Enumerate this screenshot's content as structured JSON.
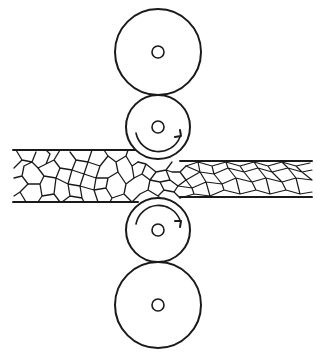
{
  "diagram": {
    "stroke_color": "#1a1a1a",
    "background": "#ffffff",
    "rolls": [
      {
        "name": "top-backup-roll",
        "cx": 158,
        "cy": 52,
        "r": 43,
        "hub_r": 6
      },
      {
        "name": "top-work-roll",
        "cx": 158,
        "cy": 127,
        "r": 32,
        "hub_r": 6
      },
      {
        "name": "bottom-work-roll",
        "cx": 158,
        "cy": 230,
        "r": 32,
        "hub_r": 6
      },
      {
        "name": "bottom-backup-roll",
        "cx": 158,
        "cy": 305,
        "r": 43,
        "hub_r": 6
      }
    ],
    "rotation_arrows": [
      {
        "name": "top-work-roll-rotation",
        "direction": "counterclockwise"
      },
      {
        "name": "bottom-work-roll-rotation",
        "direction": "clockwise"
      }
    ],
    "strip": {
      "entry": {
        "x_start": 13,
        "top": 150,
        "bottom": 202,
        "grain_shape": "equiaxed"
      },
      "exit": {
        "x_end": 312,
        "top": 161,
        "bottom": 197,
        "grain_shape": "elongated"
      }
    }
  }
}
